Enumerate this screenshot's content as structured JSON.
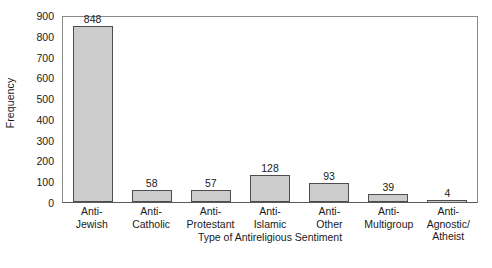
{
  "chart_data": {
    "type": "bar",
    "title": "",
    "xlabel": "Type of Antireligious Sentiment",
    "ylabel": "Frequency",
    "categories": [
      "Anti-Jewish",
      "Anti-Catholic",
      "Anti-Protestant",
      "Anti-Islamic",
      "Anti-Other",
      "Anti-Multigroup",
      "Anti-Agnostic/Atheist"
    ],
    "category_lines": [
      [
        "Anti-",
        "Jewish"
      ],
      [
        "Anti-",
        "Catholic"
      ],
      [
        "Anti-",
        "Protestant"
      ],
      [
        "Anti-",
        "Islamic"
      ],
      [
        "Anti-",
        "Other"
      ],
      [
        "Anti-",
        "Multigroup"
      ],
      [
        "Anti-",
        "Agnostic/",
        "Atheist"
      ]
    ],
    "values": [
      848,
      58,
      57,
      128,
      93,
      39,
      4
    ],
    "value_labels": [
      "848",
      "58",
      "57",
      "128",
      "93",
      "39",
      "4"
    ],
    "ylim": [
      0,
      900
    ],
    "ytick_values": [
      0,
      100,
      200,
      300,
      400,
      500,
      600,
      700,
      800,
      900
    ],
    "ytick_labels": [
      "0",
      "100",
      "200",
      "300",
      "400",
      "500",
      "600",
      "700",
      "800",
      "900"
    ],
    "grid": false,
    "legend": null,
    "bar_fill_color": "#cccccc",
    "bar_border_color": "#4d4d4d",
    "axis_color": "#5a5a5a",
    "background_color": "#ffffff"
  },
  "caption": ""
}
